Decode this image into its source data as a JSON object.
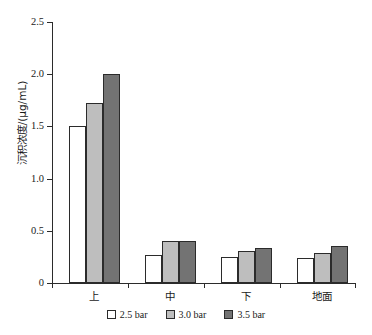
{
  "chart_data": {
    "type": "bar",
    "title": "",
    "xlabel": "",
    "ylabel": "沉积浓度/(μg/mL)",
    "ylim": [
      0,
      2.5
    ],
    "ytick_labels": [
      "0",
      "0.5",
      "1.0",
      "1.5",
      "2.0",
      "2.5"
    ],
    "ytick_values": [
      0,
      0.5,
      1.0,
      1.5,
      2.0,
      2.5
    ],
    "grid": false,
    "legend_position": "bottom",
    "categories": [
      "上",
      "中",
      "下",
      "地面"
    ],
    "series": [
      {
        "name": "2.5 bar",
        "color": "#ffffff",
        "values": [
          1.5,
          0.27,
          0.25,
          0.24
        ]
      },
      {
        "name": "3.0 bar",
        "color": "#bebebe",
        "values": [
          1.72,
          0.4,
          0.31,
          0.29
        ]
      },
      {
        "name": "3.5 bar",
        "color": "#737373",
        "values": [
          2.0,
          0.4,
          0.34,
          0.35
        ]
      }
    ]
  },
  "axis": {
    "border_color": "#2b2b2b"
  }
}
